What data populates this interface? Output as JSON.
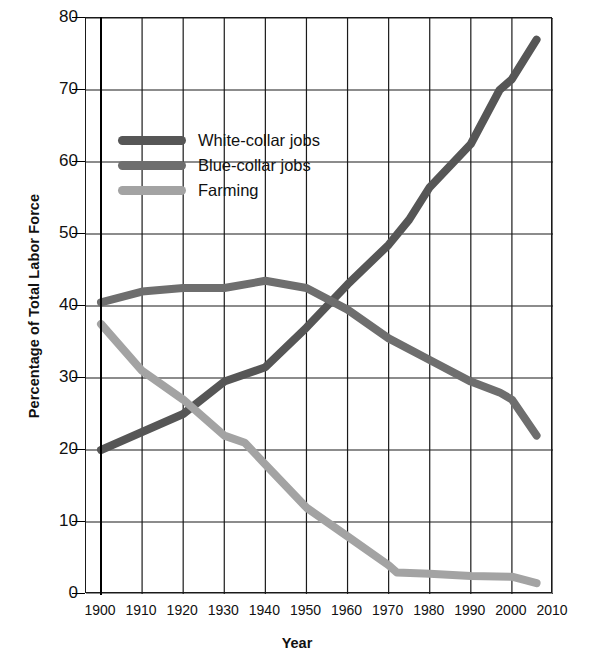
{
  "chart_data": {
    "type": "line",
    "title": "",
    "xlabel": "Year",
    "ylabel": "Percentage of Total Labor Force",
    "xlim": [
      1900,
      2010
    ],
    "ylim": [
      0,
      80
    ],
    "grid": true,
    "legend_position": "upper-left-inside",
    "xticks": [
      "1900",
      "1910",
      "1920",
      "1930",
      "1940",
      "1950",
      "1960",
      "1970",
      "1980",
      "1990",
      "2000",
      "2010"
    ],
    "yticks": [
      "0",
      "10",
      "20",
      "30",
      "40",
      "50",
      "60",
      "70",
      "80"
    ],
    "series": [
      {
        "name": "White-collar jobs",
        "color": "#565656",
        "x": [
          1900,
          1910,
          1920,
          1930,
          1940,
          1950,
          1960,
          1970,
          1975,
          1980,
          1990,
          1997,
          2000,
          2006
        ],
        "values": [
          20,
          22.5,
          25,
          29.5,
          31.5,
          37,
          43,
          48.5,
          52,
          56.5,
          62.5,
          70,
          71.5,
          77
        ]
      },
      {
        "name": "Blue-collar jobs",
        "color": "#6e6e6e",
        "x": [
          1900,
          1910,
          1920,
          1930,
          1940,
          1950,
          1960,
          1970,
          1980,
          1990,
          1997,
          2000,
          2006
        ],
        "values": [
          40.5,
          42,
          42.5,
          42.5,
          43.5,
          42.5,
          39.5,
          35.5,
          32.5,
          29.5,
          28,
          27,
          22
        ]
      },
      {
        "name": "Farming",
        "color": "#a3a3a3",
        "x": [
          1900,
          1910,
          1920,
          1930,
          1935,
          1940,
          1950,
          1960,
          1970,
          1972,
          1980,
          1990,
          2000,
          2006
        ],
        "values": [
          37.5,
          31,
          27,
          22,
          21,
          18,
          12,
          8,
          4,
          3,
          2.8,
          2.5,
          2.4,
          1.5
        ]
      }
    ]
  },
  "legend": {
    "items": [
      {
        "label": "White-collar jobs",
        "color": "#565656"
      },
      {
        "label": "Blue-collar jobs",
        "color": "#6e6e6e"
      },
      {
        "label": "Farming",
        "color": "#a3a3a3"
      }
    ]
  }
}
